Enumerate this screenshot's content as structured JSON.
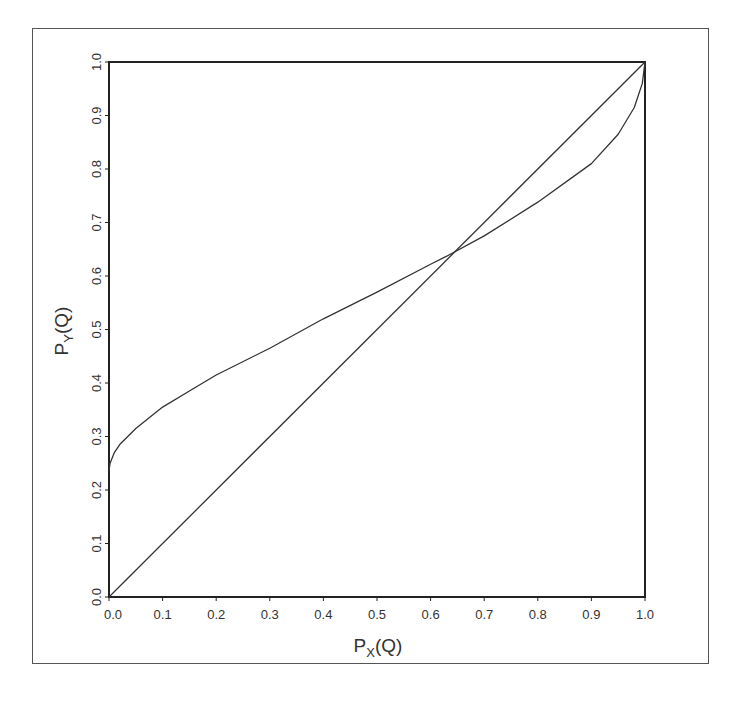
{
  "chart_data": {
    "type": "line",
    "title": "",
    "xlabel": "P_X(Q)",
    "ylabel": "P_Y(Q)",
    "xlabel_parts": {
      "main": "P",
      "sub": "X",
      "rest": "(Q)"
    },
    "ylabel_parts": {
      "main": "P",
      "sub": "Y",
      "rest": "(Q)"
    },
    "xlim": [
      0,
      1
    ],
    "ylim": [
      0,
      1
    ],
    "grid": false,
    "legend": null,
    "x_ticks": [
      "0.0",
      "0.1",
      "0.2",
      "0.3",
      "0.4",
      "0.5",
      "0.6",
      "0.7",
      "0.8",
      "0.9",
      "1.0"
    ],
    "y_ticks": [
      "0.0",
      "0.1",
      "0.2",
      "0.3",
      "0.4",
      "0.5",
      "0.6",
      "0.7",
      "0.8",
      "0.9",
      "1.0"
    ],
    "series": [
      {
        "name": "diagonal",
        "x": [
          0,
          1
        ],
        "y": [
          0,
          1
        ]
      },
      {
        "name": "curve",
        "x": [
          0,
          0.002,
          0.01,
          0.02,
          0.05,
          0.1,
          0.15,
          0.2,
          0.3,
          0.4,
          0.5,
          0.6,
          0.63,
          0.7,
          0.8,
          0.9,
          0.95,
          0.98,
          0.995,
          1.0
        ],
        "y": [
          0.236,
          0.25,
          0.27,
          0.285,
          0.315,
          0.355,
          0.385,
          0.415,
          0.465,
          0.52,
          0.57,
          0.622,
          0.637,
          0.675,
          0.738,
          0.81,
          0.865,
          0.915,
          0.96,
          1.0
        ]
      }
    ],
    "annotations": [
      {
        "type": "intersection",
        "x": 0.63,
        "y": 0.637
      }
    ]
  },
  "colors": {
    "line": "#333333",
    "axis": "#222222",
    "frame": "#555555",
    "background": "#ffffff"
  }
}
